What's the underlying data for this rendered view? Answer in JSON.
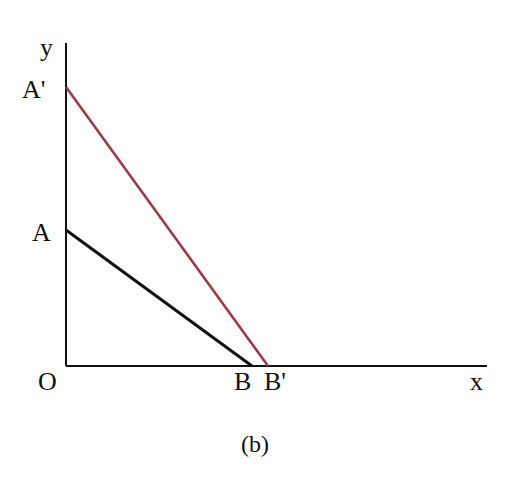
{
  "diagram": {
    "axes": {
      "x_label": "x",
      "y_label": "y",
      "origin_label": "O",
      "origin": [
        66,
        366
      ],
      "x_end": [
        487,
        366
      ],
      "y_end": [
        66,
        43
      ]
    },
    "points": {
      "A": {
        "label": "A",
        "coords": [
          66,
          230
        ]
      },
      "A_prime": {
        "label": "A'",
        "coords": [
          66,
          87
        ]
      },
      "B": {
        "label": "B",
        "coords": [
          252,
          366
        ]
      },
      "B_prime": {
        "label": "B'",
        "coords": [
          268,
          366
        ]
      }
    },
    "lines": [
      {
        "name": "AB",
        "from": "A",
        "to": "B",
        "color": "#111111"
      },
      {
        "name": "A'B'",
        "from": "A'",
        "to": "B'",
        "color": "#9b3a4a"
      }
    ],
    "caption": "(b)"
  }
}
